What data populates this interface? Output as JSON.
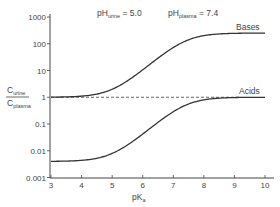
{
  "chart_data": {
    "type": "line",
    "title": "",
    "xlabel": "pKa",
    "ylabel": "C_urine / C_plasma",
    "xlim": [
      3,
      10
    ],
    "ylim": [
      0.001,
      1000
    ],
    "yscale": "log",
    "grid": false,
    "x_ticks": [
      "3",
      "4",
      "5",
      "6",
      "7",
      "8",
      "9",
      "10"
    ],
    "y_ticks": [
      "1000",
      "100",
      "10",
      "1",
      "0.1",
      "0.01",
      "0.001"
    ],
    "annotations": [
      {
        "text": "pH_urine = 5.0",
        "main": "pH",
        "sub": "urine",
        "value": "= 5.0"
      },
      {
        "text": "pH_plasma = 7.4",
        "main": "pH",
        "sub": "plasma",
        "value": "= 7.4"
      }
    ],
    "reference_line": {
      "y": 1,
      "style": "dashed"
    },
    "series": [
      {
        "name": "Bases",
        "x": [
          3,
          4,
          5,
          6,
          7,
          8,
          9,
          10
        ],
        "y": [
          1.0,
          1.1,
          2.0,
          10.4,
          71.6,
          200,
          244,
          251
        ]
      },
      {
        "name": "Acids",
        "x": [
          3,
          4,
          5,
          6,
          7,
          8,
          9,
          10
        ],
        "y": [
          0.004,
          0.0044,
          0.008,
          0.042,
          0.29,
          0.8,
          0.98,
          1.0
        ]
      }
    ]
  },
  "labels": {
    "ylabel_num": "C",
    "ylabel_num_sub": "urine",
    "ylabel_den": "C",
    "ylabel_den_sub": "plasma",
    "xlabel_main": "pK",
    "xlabel_sub": "a",
    "bases": "Bases",
    "acids": "Acids",
    "ph_urine_main": "pH",
    "ph_urine_sub": "urine",
    "ph_urine_val": " = 5.0",
    "ph_plasma_main": "pH",
    "ph_plasma_sub": "plasma",
    "ph_plasma_val": " = 7.4"
  },
  "params": {
    "pH_urine": 5.0,
    "pH_plasma": 7.4
  }
}
